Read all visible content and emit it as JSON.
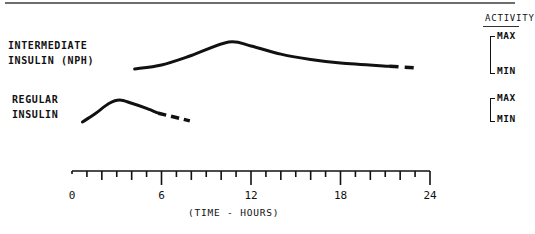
{
  "chart_data": {
    "type": "line",
    "title": "",
    "xlabel": "(TIME - HOURS)",
    "ylabel": "ACTIVITY",
    "xlim": [
      0,
      24
    ],
    "x_ticks": [
      0,
      6,
      12,
      18,
      24
    ],
    "minor_tick_step_hours": 1,
    "grid": false,
    "y_scale_labels": [
      "MAX",
      "MIN"
    ],
    "series": [
      {
        "name": "INTERMEDIATE INSULIN (NPH)",
        "unit": "relative activity (0=MIN, 1=MAX)",
        "solid": {
          "x": [
            4.2,
            6,
            8,
            10.5,
            12,
            14,
            16,
            18,
            21.3
          ],
          "y": [
            0.0,
            0.15,
            0.5,
            1.0,
            0.85,
            0.55,
            0.35,
            0.22,
            0.1
          ]
        },
        "dashed": {
          "x": [
            21.3,
            23.3
          ],
          "y": [
            0.1,
            0.03
          ]
        }
      },
      {
        "name": "REGULAR INSULIN",
        "unit": "relative activity (0=MIN, 1=MAX)",
        "solid": {
          "x": [
            0.7,
            1.5,
            2.5,
            3.2,
            4,
            5,
            5.8
          ],
          "y": [
            0.0,
            0.35,
            0.85,
            1.0,
            0.85,
            0.62,
            0.4
          ]
        },
        "dashed": {
          "x": [
            5.8,
            7.9
          ],
          "y": [
            0.4,
            0.05
          ]
        }
      }
    ]
  },
  "labels": {
    "nph_line1": "INTERMEDIATE",
    "nph_line2": "INSULIN (NPH)",
    "regular_line1": "REGULAR",
    "regular_line2": "INSULIN",
    "activity": "ACTIVITY",
    "max": "MAX",
    "min": "MIN",
    "x_title": "(TIME - HOURS)",
    "ticks": [
      "0",
      "6",
      "12",
      "18",
      "24"
    ]
  }
}
